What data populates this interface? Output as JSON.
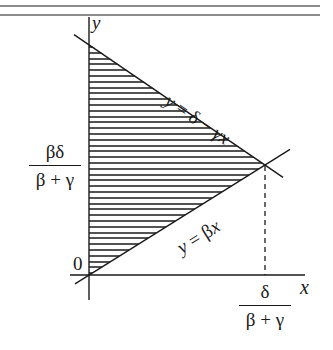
{
  "figure": {
    "type": "region-diagram",
    "axes": {
      "x_label": "x",
      "y_label": "y",
      "origin_label": "0"
    },
    "lines": [
      {
        "id": "upper",
        "equation": "y = δ − γx",
        "label_parts": [
          "y",
          " = δ − ",
          "γx"
        ]
      },
      {
        "id": "lower",
        "equation": "y = βx",
        "label_parts": [
          "y",
          " = β",
          "x"
        ]
      }
    ],
    "y_tick": {
      "numerator": "βδ",
      "denominator": "β + γ"
    },
    "x_tick": {
      "numerator": "δ",
      "denominator": "β + γ"
    },
    "shaded_region": "triangle bounded by y-axis, y = δ − γx, and y = βx",
    "colors": {
      "ink": "#1a1a1a",
      "background": "#ffffff"
    }
  }
}
